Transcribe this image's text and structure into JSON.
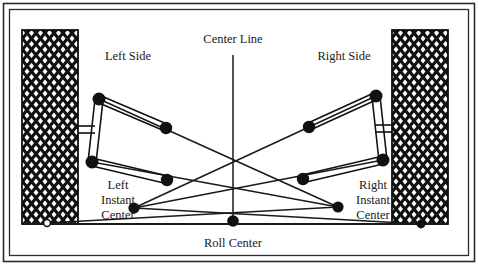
{
  "figure": {
    "type": "double-wishbone-roll-center-diagram",
    "frame": {
      "outer_color": "#2b2b2b",
      "inner_color": "#2b2b2b",
      "background": "#ffffff"
    },
    "line_color": "#1a1a1a",
    "joint_color": "#111111"
  },
  "labels": {
    "center_line": "Center Line",
    "left_side": "Left Side",
    "right_side": "Right Side",
    "left_instant_center_line1": "Left",
    "left_instant_center_line2": "Instant",
    "left_instant_center_line3": "Center",
    "right_instant_center_line1": "Right",
    "right_instant_center_line2": "Instant",
    "right_instant_center_line3": "Center",
    "roll_center": "Roll Center"
  },
  "geometry": {
    "ground_line_y": 224,
    "center_line_x": 233,
    "center_line_top": 55,
    "center_line_bottom": 224,
    "left_wheel": {
      "x": 22,
      "y": 30,
      "width": 56,
      "height": 194
    },
    "right_wheel": {
      "x": 392,
      "y": 30,
      "width": 56,
      "height": 194
    },
    "left_upper_outer": {
      "x": 99,
      "y": 99
    },
    "left_upper_inner": {
      "x": 166,
      "y": 128
    },
    "left_lower_outer": {
      "x": 92,
      "y": 162
    },
    "left_lower_inner": {
      "x": 167,
      "y": 180
    },
    "left_instant_center": {
      "x": 134,
      "y": 208
    },
    "right_upper_outer": {
      "x": 376,
      "y": 96
    },
    "right_upper_inner": {
      "x": 309,
      "y": 127
    },
    "right_lower_outer": {
      "x": 383,
      "y": 160
    },
    "right_lower_inner": {
      "x": 303,
      "y": 179
    },
    "right_instant_center": {
      "x": 338,
      "y": 207
    },
    "roll_center": {
      "x": 233,
      "y": 221
    },
    "left_contact_patch": {
      "x": 47,
      "y": 223
    },
    "right_contact_patch": {
      "x": 421,
      "y": 224
    }
  }
}
